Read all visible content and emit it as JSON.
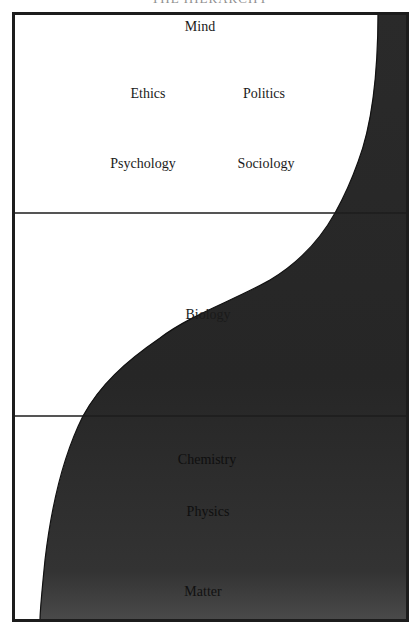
{
  "diagram": {
    "title_partial": "THE HIERARCHY",
    "frame": {
      "x": 13,
      "y": 13,
      "width": 394,
      "height": 607,
      "border_color": "#1c1c1c"
    },
    "dividers": [
      {
        "name": "upper-divider",
        "y": 213
      },
      {
        "name": "lower-divider",
        "y": 416
      }
    ],
    "colors": {
      "background": "#ffffff",
      "fill_dark": "#262626",
      "fill_dark_bottom": "#454545",
      "line": "#1c1c1c",
      "text": "#1a1a1a"
    },
    "curve_points": [
      [
        378,
        13
      ],
      [
        377,
        62
      ],
      [
        370,
        112
      ],
      [
        358,
        162
      ],
      [
        335,
        213
      ],
      [
        300,
        263
      ],
      [
        243,
        293
      ],
      [
        180,
        323
      ],
      [
        143,
        353
      ],
      [
        110,
        383
      ],
      [
        83,
        416
      ],
      [
        63,
        466
      ],
      [
        52,
        516
      ],
      [
        45,
        566
      ],
      [
        40,
        620
      ]
    ],
    "sections": {
      "top": {
        "labels": [
          {
            "text": "Mind",
            "x": 200,
            "y": 27
          },
          {
            "text": "Ethics",
            "x": 148,
            "y": 94
          },
          {
            "text": "Politics",
            "x": 264,
            "y": 94
          },
          {
            "text": "Psychology",
            "x": 143,
            "y": 164
          },
          {
            "text": "Sociology",
            "x": 266,
            "y": 164
          }
        ]
      },
      "middle": {
        "labels": [
          {
            "text": "Biology",
            "x": 208,
            "y": 315
          }
        ]
      },
      "bottom": {
        "labels": [
          {
            "text": "Chemistry",
            "x": 207,
            "y": 460
          },
          {
            "text": "Physics",
            "x": 208,
            "y": 512
          },
          {
            "text": "Matter",
            "x": 203,
            "y": 592
          }
        ]
      }
    }
  }
}
